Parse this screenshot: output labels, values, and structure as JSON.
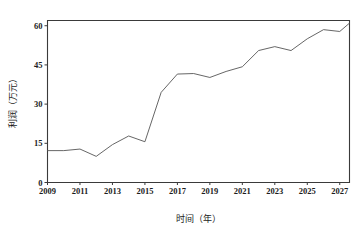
{
  "chart_data": {
    "type": "line",
    "title": "",
    "xlabel": "时间（年）",
    "ylabel": "利润（万元）",
    "xlim": [
      2009,
      2027.6
    ],
    "ylim": [
      0,
      62
    ],
    "grid": false,
    "legend": "none",
    "x_tick_labels": [
      "2009",
      "2011",
      "2013",
      "2015",
      "2017",
      "2019",
      "2021",
      "2023",
      "2025",
      "2027"
    ],
    "x_ticks": [
      2009,
      2011,
      2013,
      2015,
      2017,
      2019,
      2021,
      2023,
      2025,
      2027
    ],
    "y_tick_labels": [
      "0",
      "15",
      "30",
      "45",
      "60"
    ],
    "y_ticks": [
      0,
      15,
      30,
      45,
      60
    ],
    "line_color": "#555555",
    "axis_color": "#3a3a3a",
    "background_color": "#ffffff",
    "x": [
      2009,
      2010,
      2011,
      2012,
      2013,
      2014,
      2015,
      2016,
      2017,
      2018,
      2019,
      2020,
      2021,
      2022,
      2023,
      2024,
      2025,
      2026,
      2027,
      2027.6
    ],
    "series": [
      {
        "name": "利润",
        "values": [
          12.2,
          12.2,
          12.8,
          10.0,
          14.5,
          17.8,
          15.6,
          34.5,
          41.5,
          41.7,
          40.2,
          42.5,
          44.3,
          50.5,
          52.0,
          50.5,
          55.0,
          58.5,
          57.8,
          61.0
        ]
      }
    ]
  },
  "axis_titles": {
    "x": "时间（年）",
    "y": "利润（万元）"
  }
}
